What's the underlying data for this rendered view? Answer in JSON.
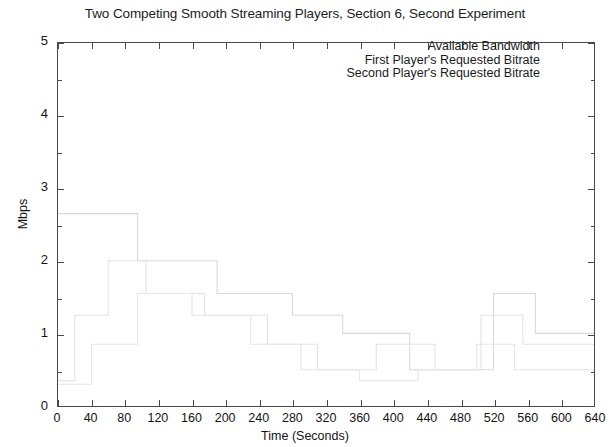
{
  "chart_data": {
    "type": "line",
    "title": "Two Competing Smooth Streaming Players, Section 6, Second Experiment",
    "xlabel": "Time (Seconds)",
    "ylabel": "Mbps",
    "xlim": [
      0,
      640
    ],
    "ylim": [
      0,
      5
    ],
    "xticks": [
      0,
      40,
      80,
      120,
      160,
      200,
      240,
      280,
      320,
      360,
      400,
      440,
      480,
      520,
      560,
      600,
      640
    ],
    "yticks": [
      0,
      1,
      2,
      3,
      4,
      5
    ],
    "grid": false,
    "legend_position": "top-right",
    "render_note": "faded-washed-out",
    "series": [
      {
        "name": "Available Bandwidth",
        "color": "#d9d9d9",
        "points": [
          [
            0,
            2.65
          ],
          [
            95,
            2.65
          ],
          [
            95,
            2.0
          ],
          [
            190,
            2.0
          ],
          [
            190,
            1.55
          ],
          [
            280,
            1.55
          ],
          [
            280,
            1.25
          ],
          [
            340,
            1.25
          ],
          [
            340,
            1.0
          ],
          [
            420,
            1.0
          ],
          [
            420,
            0.5
          ],
          [
            520,
            0.5
          ],
          [
            520,
            1.55
          ],
          [
            570,
            1.55
          ],
          [
            570,
            1.0
          ],
          [
            640,
            1.0
          ]
        ]
      },
      {
        "name": "First Player's Requested Bitrate",
        "color": "#e3e3e3",
        "points": [
          [
            0,
            0.35
          ],
          [
            20,
            0.35
          ],
          [
            20,
            1.25
          ],
          [
            60,
            1.25
          ],
          [
            60,
            2.0
          ],
          [
            105,
            2.0
          ],
          [
            105,
            1.55
          ],
          [
            175,
            1.55
          ],
          [
            175,
            1.25
          ],
          [
            250,
            1.25
          ],
          [
            250,
            0.85
          ],
          [
            310,
            0.85
          ],
          [
            310,
            0.5
          ],
          [
            380,
            0.5
          ],
          [
            380,
            0.85
          ],
          [
            450,
            0.85
          ],
          [
            450,
            0.5
          ],
          [
            505,
            0.5
          ],
          [
            505,
            1.25
          ],
          [
            555,
            1.25
          ],
          [
            555,
            0.85
          ],
          [
            640,
            0.85
          ]
        ]
      },
      {
        "name": "Second Player's Requested Bitrate",
        "color": "#e6e6e6",
        "points": [
          [
            0,
            0.3
          ],
          [
            40,
            0.3
          ],
          [
            40,
            0.85
          ],
          [
            95,
            0.85
          ],
          [
            95,
            1.55
          ],
          [
            160,
            1.55
          ],
          [
            160,
            1.25
          ],
          [
            230,
            1.25
          ],
          [
            230,
            0.85
          ],
          [
            290,
            0.85
          ],
          [
            290,
            0.5
          ],
          [
            360,
            0.5
          ],
          [
            360,
            0.35
          ],
          [
            430,
            0.35
          ],
          [
            430,
            0.5
          ],
          [
            500,
            0.5
          ],
          [
            500,
            0.85
          ],
          [
            545,
            0.85
          ],
          [
            545,
            0.5
          ],
          [
            640,
            0.5
          ]
        ]
      }
    ]
  },
  "legend": {
    "entries": [
      "Available Bandwidth",
      "First Player's Requested Bitrate",
      "Second Player's Requested Bitrate"
    ]
  }
}
